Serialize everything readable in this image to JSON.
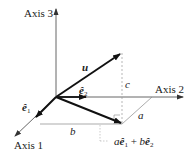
{
  "diagram": {
    "axes": {
      "axis1": "Axis 1",
      "axis2": "Axis 2",
      "axis3": "Axis 3"
    },
    "vectors": {
      "u": "u",
      "e1": "ê",
      "e1_sub": "1",
      "e2": "ê",
      "e2_sub": "2"
    },
    "components": {
      "a": "a",
      "b": "b",
      "c": "c"
    },
    "projection_label": {
      "coef_a": "a",
      "e1": "ê",
      "e1_sub": "1",
      "plus": " + ",
      "coef_b": "b",
      "e2": "ê",
      "e2_sub": "2"
    },
    "colors": {
      "vector": "#111111",
      "axis": "#333333",
      "guide": "#999999"
    }
  }
}
